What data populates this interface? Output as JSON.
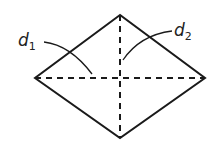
{
  "diagram": {
    "shape": "rhombus",
    "vertices": {
      "top": [
        120,
        15
      ],
      "left": [
        35,
        78
      ],
      "right": [
        205,
        78
      ],
      "bottom": [
        120,
        138
      ]
    },
    "labels": [
      {
        "text": "d",
        "sub": "1",
        "x": 22,
        "y": 44
      },
      {
        "text": "d",
        "sub": "2",
        "x": 174,
        "y": 36
      }
    ],
    "colors": {
      "stroke": "#1a1a1a"
    }
  }
}
